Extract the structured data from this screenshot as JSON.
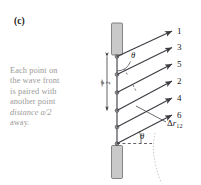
{
  "figure": {
    "panel_label": "(c)",
    "caption": "Each point on the wave front is paired with another point distance a/2 away.",
    "caption_lines": [
      "Each point on",
      "the wave front",
      "is paired with",
      "another point",
      "distance a/2",
      "away."
    ],
    "caption_italic_token": "a/2",
    "slit_width_label": "a/2",
    "angle_label_top": "θ",
    "angle_label_bottom": "θ",
    "path_difference_label": "Δr",
    "path_difference_subscript": "12",
    "ray_labels": [
      "1",
      "3",
      "5",
      "2",
      "4",
      "6"
    ],
    "source_point_count": 6,
    "colors": {
      "ink": "#3b3b42",
      "barrier_fill": "#c9c9c9",
      "barrier_stroke": "#6b6b6b",
      "caption_text": "#9c9a97",
      "label_text": "#1a1a1a",
      "background": "#ffffff",
      "dotted_arc": "#c8c8c8"
    }
  }
}
